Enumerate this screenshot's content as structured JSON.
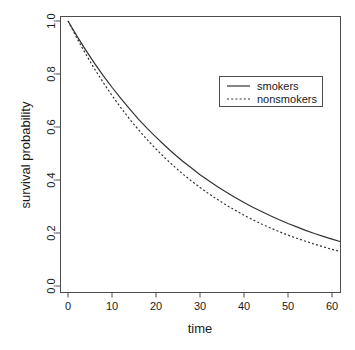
{
  "chart_data": {
    "type": "line",
    "title": "",
    "xlabel": "time",
    "ylabel": "survival probability",
    "xlim": [
      0,
      62
    ],
    "ylim": [
      0.0,
      1.0
    ],
    "grid": false,
    "legend_position": "top-right",
    "xticks": [
      0,
      10,
      20,
      30,
      40,
      50,
      60
    ],
    "xtick_labels": [
      "0",
      "10",
      "20",
      "30",
      "40",
      "50",
      "60"
    ],
    "yticks": [
      0.0,
      0.2,
      0.4,
      0.6,
      0.8,
      1.0
    ],
    "ytick_labels": [
      "0.0",
      "0.2",
      "0.4",
      "0.6",
      "0.8",
      "1.0"
    ],
    "x": [
      0,
      2,
      4,
      6,
      8,
      10,
      12,
      14,
      16,
      18,
      20,
      22,
      24,
      26,
      28,
      30,
      32,
      34,
      36,
      38,
      40,
      42,
      44,
      46,
      48,
      50,
      52,
      54,
      56,
      58,
      60,
      62
    ],
    "series": [
      {
        "name": "smokers",
        "style": "solid",
        "color": "#333333",
        "values": [
          1.0,
          0.944,
          0.891,
          0.841,
          0.794,
          0.75,
          0.708,
          0.668,
          0.63,
          0.595,
          0.562,
          0.53,
          0.5,
          0.472,
          0.446,
          0.42,
          0.397,
          0.375,
          0.354,
          0.334,
          0.315,
          0.297,
          0.281,
          0.265,
          0.25,
          0.236,
          0.223,
          0.21,
          0.198,
          0.187,
          0.177,
          0.167
        ]
      },
      {
        "name": "nonsmokers",
        "style": "dotted",
        "color": "#333333",
        "values": [
          1.0,
          0.936,
          0.876,
          0.82,
          0.768,
          0.719,
          0.673,
          0.63,
          0.59,
          0.552,
          0.517,
          0.484,
          0.453,
          0.424,
          0.397,
          0.372,
          0.348,
          0.326,
          0.305,
          0.286,
          0.267,
          0.25,
          0.234,
          0.219,
          0.205,
          0.192,
          0.18,
          0.169,
          0.158,
          0.148,
          0.138,
          0.13
        ]
      }
    ],
    "legend": [
      {
        "label": "smokers",
        "style": "solid"
      },
      {
        "label": "nonsmokers",
        "style": "dotted"
      }
    ]
  },
  "axes": {
    "x_title": "time",
    "y_title": "survival probability"
  }
}
